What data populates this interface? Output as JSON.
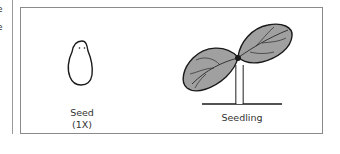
{
  "margin_text": [
    "e",
    "e"
  ],
  "figure": {
    "items": [
      {
        "label": "Seed",
        "sublabel": "(1X)",
        "icon": "seed-icon"
      },
      {
        "label": "Seedling",
        "icon": "seedling-icon"
      }
    ]
  },
  "colors": {
    "leaf_fill": "#9e9e9e",
    "outline": "#1a1a1a",
    "frame": "#8a8a8a"
  }
}
